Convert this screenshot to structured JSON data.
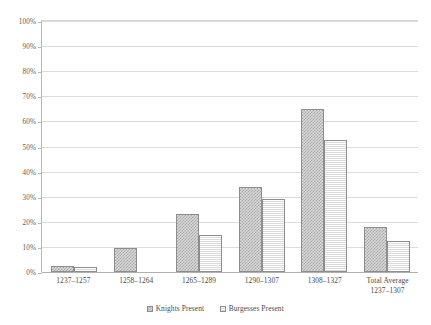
{
  "chart_data": {
    "type": "bar",
    "title": "",
    "subtitle": "",
    "xlabel": "",
    "ylabel": "",
    "ylim": [
      0,
      100
    ],
    "yticks": [
      "0%",
      "10%",
      "20%",
      "30%",
      "40%",
      "50%",
      "60%",
      "70%",
      "80%",
      "90%",
      "100%"
    ],
    "ytick_values": [
      0,
      10,
      20,
      30,
      40,
      50,
      60,
      70,
      80,
      90,
      100
    ],
    "grid": true,
    "legend_position": "bottom",
    "categories": [
      "1237–1257",
      "1258–1264",
      "1265–1289",
      "1290–1307",
      "1308–1327",
      "Total Average\n1237–1307"
    ],
    "series": [
      {
        "name": "Knights Present",
        "pattern": "checkerboard",
        "color": "#a8a8a8",
        "values": [
          2.2,
          9.5,
          23.0,
          34.0,
          65.0,
          17.8
        ]
      },
      {
        "name": "Burgesses Present",
        "pattern": "horizontal-lines",
        "color": "#dadada",
        "values": [
          2.0,
          null,
          14.8,
          29.0,
          52.5,
          12.5
        ]
      }
    ]
  },
  "legend": {
    "items": [
      {
        "label": "Knights Present"
      },
      {
        "label": "Burgesses Present"
      }
    ]
  }
}
